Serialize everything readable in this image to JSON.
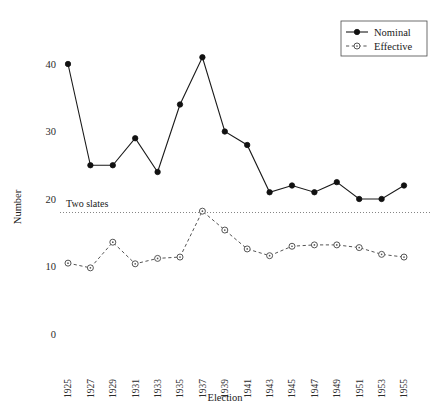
{
  "chart_data": {
    "type": "line",
    "title": "",
    "xlabel": "Election",
    "ylabel": "Number",
    "x": [
      1925,
      1927,
      1929,
      1931,
      1933,
      1935,
      1937,
      1939,
      1941,
      1943,
      1945,
      1947,
      1949,
      1951,
      1953,
      1955
    ],
    "xtick_labels": [
      "1925",
      "1927",
      "1929",
      "1931",
      "1933",
      "1935",
      "1937",
      "1939",
      "1941",
      "1943",
      "1945",
      "1947",
      "1949",
      "1951",
      "1953",
      "1955"
    ],
    "ytick_labels": [
      "0",
      "10",
      "20",
      "30",
      "40"
    ],
    "yticks": [
      0,
      10,
      20,
      30,
      40
    ],
    "ylim": [
      0,
      43
    ],
    "xlim": [
      1924,
      1956
    ],
    "grid": false,
    "legend_position": "top-right",
    "series": [
      {
        "name": "Nominal",
        "marker": "filled-circle",
        "linestyle": "solid",
        "values": [
          40,
          25,
          25,
          29,
          24,
          34,
          41,
          30,
          28,
          21,
          22,
          21,
          22.5,
          20,
          20,
          22
        ]
      },
      {
        "name": "Effective",
        "marker": "open-circle",
        "linestyle": "dashed",
        "values": [
          10.5,
          9.8,
          13.6,
          10.4,
          11.2,
          11.4,
          18.2,
          15.4,
          12.6,
          11.6,
          13.0,
          13.2,
          13.2,
          12.8,
          11.8,
          11.4
        ]
      }
    ],
    "annotations": [
      {
        "label": "Two slates",
        "type": "horizontal-reference-line",
        "value": 18
      }
    ]
  },
  "legend": {
    "entries": [
      {
        "label": "Nominal"
      },
      {
        "label": "Effective"
      }
    ]
  }
}
